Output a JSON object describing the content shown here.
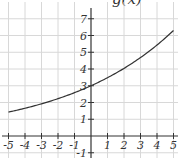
{
  "chart_data": {
    "type": "line",
    "title": "g(x)",
    "xlabel": "",
    "ylabel": "",
    "xlim": [
      -5,
      5
    ],
    "ylim": [
      -1,
      7
    ],
    "grid": true,
    "x_ticks": [
      -5,
      -4,
      -3,
      -2,
      -1,
      1,
      2,
      3,
      4,
      5
    ],
    "y_ticks": [
      -1,
      1,
      2,
      3,
      4,
      5,
      6,
      7
    ],
    "series": [
      {
        "name": "g(x)",
        "color": "#333333",
        "x": [
          -5,
          -4,
          -3,
          -2,
          -1,
          0,
          1,
          2,
          3,
          4,
          5
        ],
        "y": [
          1.43,
          1.66,
          1.92,
          2.23,
          2.59,
          3.0,
          3.48,
          4.04,
          4.68,
          5.43,
          6.3
        ]
      }
    ]
  },
  "colors": {
    "grid": "#d8d8d8",
    "axis": "#333333",
    "curve": "#333333"
  }
}
